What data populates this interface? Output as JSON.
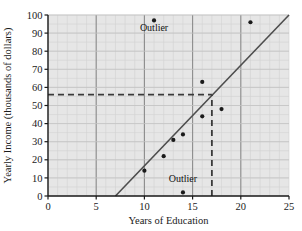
{
  "chart_data": {
    "type": "scatter",
    "title": "",
    "xlabel": "Years of Education",
    "ylabel": "Yearly Income (thousands of dollars)",
    "xlim": [
      0,
      25
    ],
    "ylim": [
      0,
      100
    ],
    "xticks": [
      0,
      5,
      10,
      15,
      20,
      25
    ],
    "yticks": [
      0,
      10,
      20,
      30,
      40,
      50,
      60,
      70,
      80,
      90,
      100
    ],
    "xtick_labels": [
      "0",
      "5",
      "10",
      "15",
      "20",
      "25"
    ],
    "ytick_labels": [
      "0",
      "10",
      "20",
      "30",
      "40",
      "50",
      "60",
      "70",
      "80",
      "90",
      "100"
    ],
    "grid": true,
    "grid_minor_step_x": 1,
    "grid_minor_step_y": 5,
    "grid_major_step_x": 5,
    "grid_major_step_y": 10,
    "legend": "none",
    "plot_background": "#e6e6e6",
    "points": [
      {
        "x": 10,
        "y": 14
      },
      {
        "x": 11,
        "y": 97,
        "label": "Outlier"
      },
      {
        "x": 12,
        "y": 22
      },
      {
        "x": 13,
        "y": 31
      },
      {
        "x": 14,
        "y": 34
      },
      {
        "x": 14,
        "y": 2,
        "label": "Outlier"
      },
      {
        "x": 16,
        "y": 63
      },
      {
        "x": 16,
        "y": 44
      },
      {
        "x": 18,
        "y": 48
      },
      {
        "x": 21,
        "y": 96
      }
    ],
    "trend_line": {
      "name": "regression line",
      "x_start": 7,
      "y_start": 0,
      "x_end": 25,
      "y_end": 100
    },
    "reference_lines": [
      {
        "name": "horizontal-predicted-income",
        "orientation": "horizontal",
        "value": 56,
        "x_from": 0,
        "x_to": 17,
        "style": "dashed"
      },
      {
        "name": "vertical-education-level",
        "orientation": "vertical",
        "value": 17,
        "y_from": 0,
        "y_to": 56,
        "style": "dashed"
      }
    ],
    "annotations": [
      {
        "name": "outlier-high",
        "text": "Outlier",
        "x": 11,
        "y": 91
      },
      {
        "name": "outlier-low",
        "text": "Outlier",
        "x": 14,
        "y": 8
      }
    ],
    "colors": {
      "point": "#1a1a1a",
      "line": "#4d4d4d",
      "dashed": "#3a3a3a",
      "axis": "#1a1a1a",
      "grid_minor": "#d2d2d2",
      "grid_major": "#8c8c8c",
      "background": "#e6e6e6"
    }
  }
}
